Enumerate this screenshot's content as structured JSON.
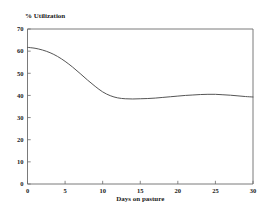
{
  "chart_data": {
    "type": "line",
    "title": "",
    "ylabel": "% Utilization",
    "xlabel": "Days on pasture",
    "xlim": [
      0,
      30
    ],
    "ylim": [
      0,
      70
    ],
    "xticks": [
      0,
      5,
      10,
      15,
      20,
      25,
      30
    ],
    "xtick_labels": [
      "0",
      "5",
      "10",
      "15",
      "20",
      "25",
      "30"
    ],
    "yticks": [
      0,
      10,
      20,
      30,
      40,
      50,
      60,
      70
    ],
    "ytick_labels": [
      "0",
      "10",
      "20",
      "30",
      "40",
      "50",
      "60",
      "70"
    ],
    "grid": false,
    "legend": false,
    "legend_position": "none",
    "line_color": "#555555",
    "frame_color": "#6b6b6b",
    "background_color": "#ffffff",
    "series": [
      {
        "name": "% Utilization",
        "x": [
          0,
          1,
          2,
          3,
          4,
          5,
          6,
          7,
          8,
          9,
          10,
          11,
          12,
          13,
          14,
          15,
          16,
          17,
          18,
          19,
          20,
          21,
          22,
          23,
          24,
          25,
          26,
          27,
          28,
          29,
          30
        ],
        "values": [
          61.7,
          61.3,
          60.5,
          59.3,
          57.6,
          55.4,
          52.8,
          49.9,
          46.9,
          44.1,
          41.6,
          39.9,
          38.9,
          38.5,
          38.4,
          38.5,
          38.6,
          38.8,
          39.1,
          39.4,
          39.7,
          40.0,
          40.2,
          40.4,
          40.5,
          40.5,
          40.3,
          40.1,
          39.8,
          39.5,
          39.3
        ]
      }
    ],
    "annotations": []
  },
  "axes": {
    "ylabel_text": "% Utilization",
    "xlabel_text": "Days on pasture"
  }
}
